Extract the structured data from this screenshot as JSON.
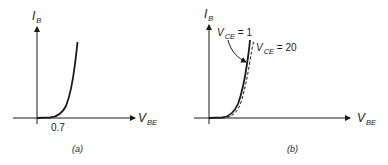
{
  "figure": {
    "panels": [
      {
        "id": "a",
        "caption": "(a)",
        "y_axis": {
          "symbol": "I",
          "subscript": "B"
        },
        "x_axis": {
          "symbol": "V",
          "subscript": "BE"
        },
        "tick_label": "0.7",
        "curves": [
          {
            "style": "solid",
            "description": "I_B vs V_BE diode-like exponential"
          }
        ]
      },
      {
        "id": "b",
        "caption": "(b)",
        "y_axis": {
          "symbol": "I",
          "subscript": "B"
        },
        "x_axis": {
          "symbol": "V",
          "subscript": "BE"
        },
        "curves": [
          {
            "style": "solid",
            "label_symbol": "V",
            "label_subscript": "CE",
            "label_value": " = 1"
          },
          {
            "style": "dashed",
            "label_symbol": "V",
            "label_subscript": "CE",
            "label_value": " = 20"
          }
        ]
      }
    ],
    "colors": {
      "ink": "#1a1a1a",
      "background": "#ffffff"
    }
  }
}
